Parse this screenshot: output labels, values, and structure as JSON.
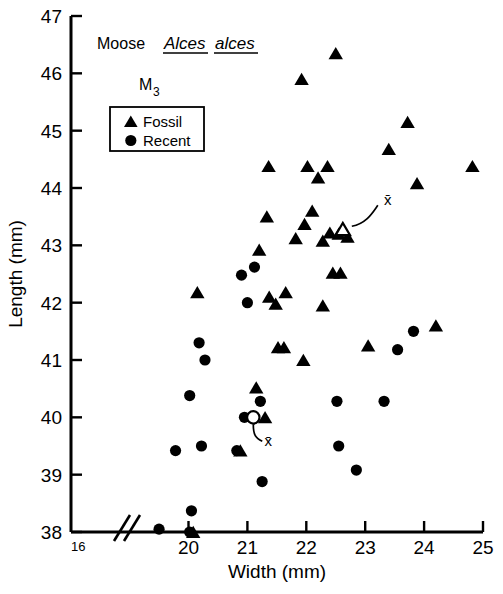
{
  "figure": {
    "header_common_name": "Moose",
    "header_genus": "Alces",
    "header_species": "alces",
    "tooth_label_main": "M",
    "tooth_label_sub": "3",
    "mean_symbol_fossil": "x̄",
    "mean_symbol_recent": "x̄"
  },
  "legend": {
    "items": [
      {
        "marker": "triangle-filled-icon",
        "label": "Fossil"
      },
      {
        "marker": "circle-filled-icon",
        "label": "Recent"
      }
    ]
  },
  "chart_data": {
    "type": "scatter",
    "xlabel": "Width (mm)",
    "ylabel": "Length (mm)",
    "xlim": [
      16,
      25
    ],
    "ylim": [
      38,
      47
    ],
    "xticks": [
      16,
      20,
      21,
      22,
      23,
      24,
      25
    ],
    "xticklabels": [
      "16",
      "20",
      "21",
      "22",
      "23",
      "24",
      "25"
    ],
    "yticks": [
      38,
      39,
      40,
      41,
      42,
      43,
      44,
      45,
      46,
      47
    ],
    "yticklabels": [
      "38",
      "39",
      "40",
      "41",
      "42",
      "43",
      "44",
      "45",
      "46",
      "47"
    ],
    "axis_break": {
      "axis": "x",
      "between": [
        16,
        20
      ],
      "marker": "double-slash"
    },
    "grid": false,
    "legend_position": "upper-left",
    "series": [
      {
        "name": "Fossil",
        "marker": "triangle",
        "fill": "#000000",
        "points": [
          [
            22.5,
            46.35
          ],
          [
            21.92,
            45.9
          ],
          [
            23.72,
            45.15
          ],
          [
            23.4,
            44.68
          ],
          [
            21.36,
            44.38
          ],
          [
            22.02,
            44.38
          ],
          [
            22.36,
            44.38
          ],
          [
            24.82,
            44.38
          ],
          [
            22.2,
            44.18
          ],
          [
            23.88,
            44.08
          ],
          [
            22.1,
            43.6
          ],
          [
            21.33,
            43.5
          ],
          [
            21.97,
            43.37
          ],
          [
            22.4,
            43.22
          ],
          [
            22.55,
            43.2
          ],
          [
            21.82,
            43.12
          ],
          [
            22.7,
            43.15
          ],
          [
            22.28,
            43.08
          ],
          [
            21.2,
            42.92
          ],
          [
            22.45,
            42.52
          ],
          [
            22.58,
            42.52
          ],
          [
            20.15,
            42.18
          ],
          [
            21.65,
            42.18
          ],
          [
            21.37,
            42.1
          ],
          [
            21.48,
            41.98
          ],
          [
            22.28,
            41.95
          ],
          [
            24.2,
            41.6
          ],
          [
            21.52,
            41.22
          ],
          [
            21.62,
            41.22
          ],
          [
            23.05,
            41.25
          ],
          [
            21.95,
            41.0
          ],
          [
            21.15,
            40.52
          ],
          [
            21.3,
            40.0
          ],
          [
            20.88,
            39.42
          ],
          [
            20.08,
            38.0
          ]
        ]
      },
      {
        "name": "Recent",
        "marker": "circle",
        "fill": "#000000",
        "points": [
          [
            21.12,
            42.62
          ],
          [
            20.9,
            42.48
          ],
          [
            21.0,
            42.0
          ],
          [
            20.18,
            41.3
          ],
          [
            20.28,
            41.0
          ],
          [
            23.82,
            41.5
          ],
          [
            23.55,
            41.18
          ],
          [
            20.02,
            40.38
          ],
          [
            21.22,
            40.28
          ],
          [
            22.52,
            40.28
          ],
          [
            23.32,
            40.28
          ],
          [
            20.95,
            40.0
          ],
          [
            20.22,
            39.5
          ],
          [
            22.55,
            39.5
          ],
          [
            19.78,
            39.42
          ],
          [
            20.82,
            39.42
          ],
          [
            22.85,
            39.08
          ],
          [
            21.25,
            38.88
          ],
          [
            20.05,
            38.37
          ],
          [
            16.7,
            38.15
          ],
          [
            19.5,
            38.05
          ],
          [
            20.02,
            38.0
          ]
        ]
      }
    ],
    "means": [
      {
        "name": "Fossil mean",
        "marker": "triangle-open",
        "x": 22.62,
        "y": 43.28,
        "label": "x̄"
      },
      {
        "name": "Recent mean",
        "marker": "circle-open",
        "x": 21.1,
        "y": 40.0,
        "label": "x̄"
      }
    ]
  }
}
